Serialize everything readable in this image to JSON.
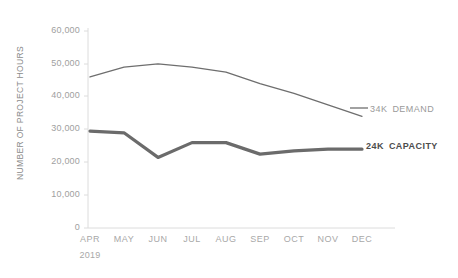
{
  "chart_data": {
    "type": "line",
    "title": "",
    "xlabel": "2019",
    "ylabel": "NUMBER OF PROJECT HOURS",
    "categories": [
      "APR",
      "MAY",
      "JUN",
      "JUL",
      "AUG",
      "SEP",
      "OCT",
      "NOV",
      "DEC"
    ],
    "ylim": [
      0,
      60000
    ],
    "yticks": [
      0,
      10000,
      20000,
      30000,
      40000,
      50000,
      60000
    ],
    "ytick_labels": [
      "0",
      "10,000",
      "20,000",
      "30,000",
      "40,000",
      "50,000",
      "60,000"
    ],
    "grid": false,
    "legend_position": "right-inline",
    "series": [
      {
        "name": "DEMAND",
        "values": [
          46000,
          49000,
          50000,
          49000,
          47500,
          44000,
          41000,
          37500,
          34000
        ],
        "end_label_value": "34K",
        "end_label_name": "DEMAND",
        "color": "#6e6e6e",
        "width": 1.3
      },
      {
        "name": "CAPACITY",
        "values": [
          29500,
          29000,
          21500,
          26000,
          26000,
          22500,
          23500,
          24000,
          24000
        ],
        "end_label_value": "24K",
        "end_label_name": "CAPACITY",
        "color": "#6b6b6b",
        "width": 3.2
      }
    ]
  },
  "axis": {
    "y_title": "NUMBER OF PROJECT HOURS",
    "year": "2019",
    "tick_0": "0",
    "tick_10000": "10,000",
    "tick_20000": "20,000",
    "tick_30000": "30,000",
    "tick_40000": "40,000",
    "tick_50000": "50,000",
    "tick_60000": "60,000"
  },
  "months": {
    "m0": "APR",
    "m1": "MAY",
    "m2": "JUN",
    "m3": "JUL",
    "m4": "AUG",
    "m5": "SEP",
    "m6": "OCT",
    "m7": "NOV",
    "m8": "DEC"
  },
  "legend": {
    "demand_value": "34K",
    "demand_name": "DEMAND",
    "capacity_value": "24K",
    "capacity_name": "CAPACITY"
  },
  "colors": {
    "demand_line": "#6e6e6e",
    "capacity_line": "#6b6b6b",
    "axis": "#d8d8d8",
    "tick_text": "#a0a0a0",
    "label_text": "#8b8b8b",
    "background": "#ffffff"
  }
}
